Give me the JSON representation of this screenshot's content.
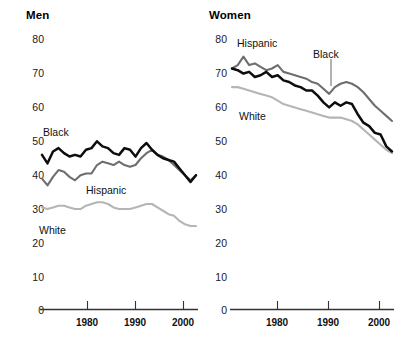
{
  "figure": {
    "background_color": "#ffffff",
    "series_colors": {
      "black_series": "#0d0d0d",
      "hispanic_series": "#6e6e6e",
      "white_series": "#b5b5b5"
    },
    "axis_color": "#333333"
  },
  "panels": [
    {
      "id": "men",
      "title": "Men",
      "y_ticks": [
        "80",
        "70",
        "60",
        "50",
        "40",
        "30",
        "20",
        "10",
        "0"
      ],
      "x_ticks": [
        "1980",
        "1990",
        "2000"
      ],
      "series_labels": [
        {
          "name": "Black",
          "text": "Black"
        },
        {
          "name": "Hispanic",
          "text": "Hispanic"
        },
        {
          "name": "White",
          "text": "White"
        }
      ]
    },
    {
      "id": "women",
      "title": "Women",
      "y_ticks": [
        "80",
        "70",
        "60",
        "50",
        "40",
        "30",
        "20",
        "10",
        "0"
      ],
      "x_ticks": [
        "1980",
        "1990",
        "2000"
      ],
      "series_labels": [
        {
          "name": "Hispanic",
          "text": "Hispanic"
        },
        {
          "name": "Black",
          "text": "Black"
        },
        {
          "name": "White",
          "text": "White"
        }
      ]
    }
  ],
  "chart_data": [
    {
      "type": "line",
      "title": "Men",
      "xlabel": "",
      "ylabel": "",
      "xlim": [
        1974,
        2002
      ],
      "ylim": [
        0,
        80
      ],
      "yticks": [
        0,
        10,
        20,
        30,
        40,
        50,
        60,
        70,
        80
      ],
      "xticks": [
        1980,
        1990,
        2000
      ],
      "grid": false,
      "legend": "inline-labels",
      "x": [
        1974,
        1975,
        1976,
        1977,
        1978,
        1979,
        1980,
        1981,
        1982,
        1983,
        1984,
        1985,
        1986,
        1987,
        1988,
        1989,
        1990,
        1991,
        1992,
        1993,
        1994,
        1995,
        1996,
        1997,
        1998,
        1999,
        2000,
        2001,
        2002
      ],
      "series": [
        {
          "name": "Black",
          "color": "#0d0d0d",
          "values": [
            45.5,
            43.0,
            46.5,
            47.5,
            46.0,
            45.0,
            45.5,
            45.0,
            47.0,
            47.5,
            49.5,
            48.0,
            47.5,
            46.0,
            45.5,
            47.5,
            47.0,
            45.0,
            47.5,
            49.0,
            47.0,
            45.5,
            44.5,
            44.0,
            43.5,
            41.5,
            39.5,
            37.5,
            39.5
          ]
        },
        {
          "name": "Hispanic",
          "color": "#6e6e6e",
          "values": [
            38.5,
            36.5,
            39.0,
            41.0,
            40.5,
            39.0,
            38.0,
            39.5,
            40.0,
            40.0,
            42.5,
            43.5,
            43.0,
            42.5,
            43.5,
            42.5,
            42.0,
            42.5,
            44.5,
            46.0,
            47.0,
            45.5,
            45.0,
            44.0,
            42.5,
            41.0,
            39.5,
            38.0,
            39.5
          ]
        },
        {
          "name": "White",
          "color": "#b5b5b5",
          "values": [
            30.0,
            29.5,
            30.0,
            30.5,
            30.5,
            30.0,
            29.5,
            29.5,
            30.5,
            31.0,
            31.5,
            31.5,
            31.0,
            30.0,
            29.5,
            29.5,
            29.5,
            30.0,
            30.5,
            31.0,
            31.0,
            30.0,
            29.0,
            28.0,
            27.5,
            26.0,
            25.0,
            24.5,
            24.5
          ]
        }
      ]
    },
    {
      "type": "line",
      "title": "Women",
      "xlabel": "",
      "ylabel": "",
      "xlim": [
        1974,
        2002
      ],
      "ylim": [
        0,
        80
      ],
      "yticks": [
        0,
        10,
        20,
        30,
        40,
        50,
        60,
        70,
        80
      ],
      "xticks": [
        1980,
        1990,
        2000
      ],
      "grid": false,
      "legend": "inline-labels",
      "x": [
        1974,
        1975,
        1976,
        1977,
        1978,
        1979,
        1980,
        1981,
        1982,
        1983,
        1984,
        1985,
        1986,
        1987,
        1988,
        1989,
        1990,
        1991,
        1992,
        1993,
        1994,
        1995,
        1996,
        1997,
        1998,
        1999,
        2000,
        2001,
        2002
      ],
      "series": [
        {
          "name": "Hispanic",
          "color": "#6e6e6e",
          "values": [
            71.0,
            72.0,
            74.5,
            72.0,
            72.5,
            71.5,
            70.5,
            71.0,
            72.0,
            70.0,
            69.5,
            69.0,
            68.5,
            68.0,
            67.0,
            66.5,
            65.0,
            63.5,
            65.5,
            66.5,
            67.0,
            66.5,
            65.5,
            64.0,
            62.0,
            60.0,
            58.5,
            57.0,
            55.5
          ]
        },
        {
          "name": "Black",
          "color": "#0d0d0d",
          "values": [
            71.0,
            70.5,
            69.5,
            70.0,
            68.5,
            69.0,
            70.0,
            68.5,
            69.0,
            67.5,
            67.0,
            66.0,
            65.5,
            64.5,
            64.5,
            63.0,
            61.0,
            59.5,
            61.0,
            60.0,
            61.0,
            60.5,
            57.5,
            55.0,
            54.0,
            52.0,
            51.5,
            48.0,
            46.5
          ]
        },
        {
          "name": "White",
          "color": "#b5b5b5",
          "values": [
            65.5,
            65.5,
            65.0,
            64.5,
            64.0,
            63.5,
            63.0,
            62.5,
            61.5,
            60.5,
            60.0,
            59.5,
            59.0,
            58.5,
            58.0,
            57.5,
            57.0,
            56.5,
            56.5,
            56.5,
            56.0,
            55.5,
            54.5,
            53.0,
            51.5,
            50.0,
            48.5,
            47.0,
            46.0
          ]
        }
      ]
    }
  ]
}
